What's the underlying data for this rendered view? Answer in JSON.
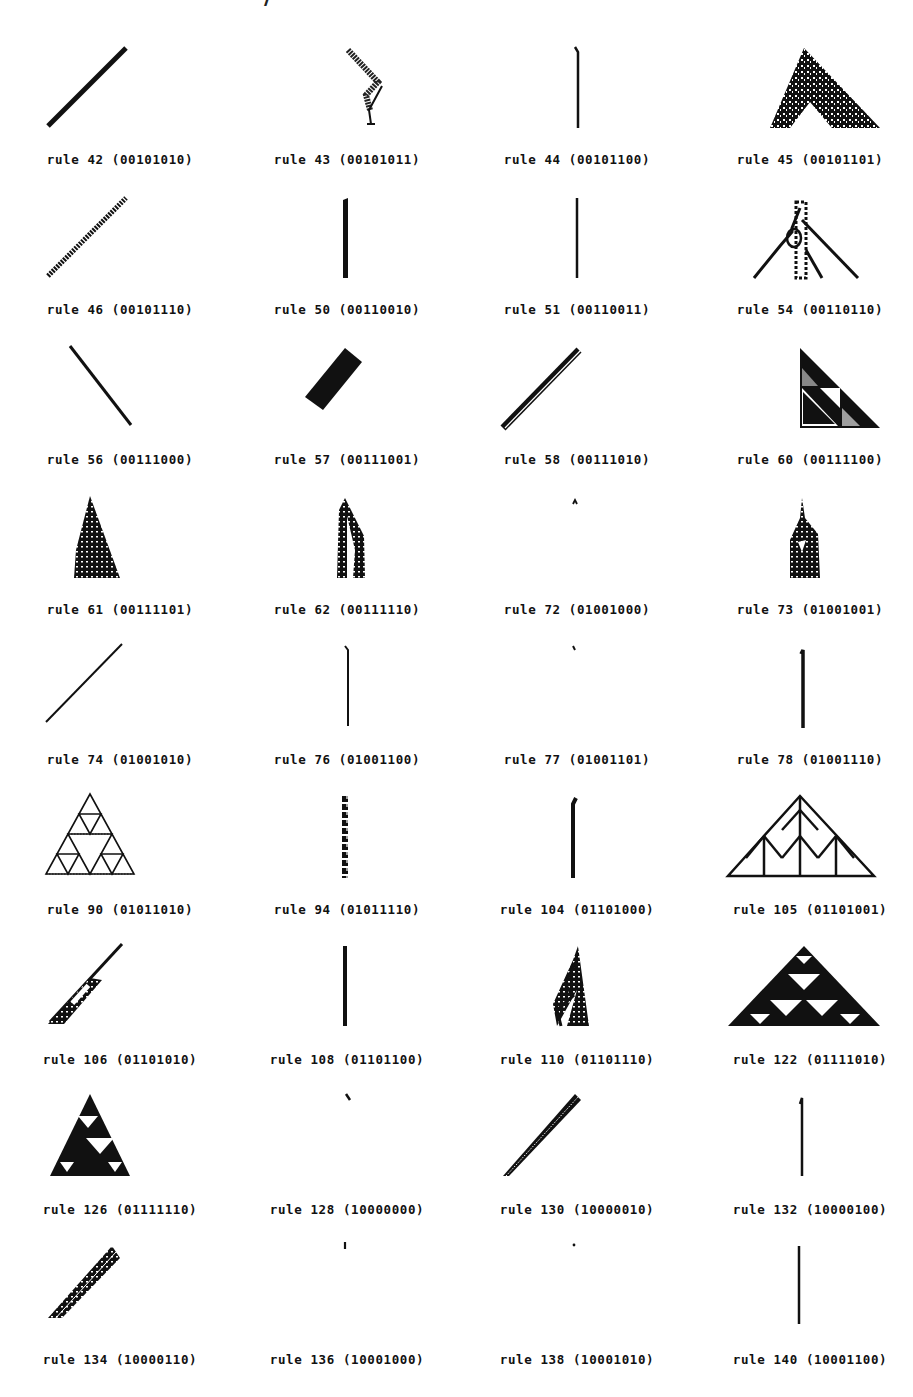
{
  "page": {
    "title_fragment": "…………  ……  ……, …/",
    "figure_type": "cellular automaton evolution patterns from single seed"
  },
  "patterns": [
    {
      "rule": 42,
      "label": "rule 42 (00101010)",
      "shape": "diag-right"
    },
    {
      "rule": 43,
      "label": "rule 43 (00101011)",
      "shape": "zigzag"
    },
    {
      "rule": 44,
      "label": "rule 44 (00101100)",
      "shape": "vertical-thin"
    },
    {
      "rule": 45,
      "label": "rule 45 (00101101)",
      "shape": "chaotic-triangle"
    },
    {
      "rule": 46,
      "label": "rule 46 (00101110)",
      "shape": "diag-right-dotted"
    },
    {
      "rule": 50,
      "label": "rule 50 (00110010)",
      "shape": "vertical-thick"
    },
    {
      "rule": 51,
      "label": "rule 51 (00110011)",
      "shape": "vertical-thin"
    },
    {
      "rule": 54,
      "label": "rule 54 (00110110)",
      "shape": "complex-triangle"
    },
    {
      "rule": 56,
      "label": "rule 56 (00111000)",
      "shape": "diag-left"
    },
    {
      "rule": 57,
      "label": "rule 57 (00111001)",
      "shape": "thick-band"
    },
    {
      "rule": 58,
      "label": "rule 58 (00111010)",
      "shape": "diag-right-double"
    },
    {
      "rule": 60,
      "label": "rule 60 (00111100)",
      "shape": "sierpinski-right"
    },
    {
      "rule": 61,
      "label": "rule 61 (00111101)",
      "shape": "chaotic-triangle-left"
    },
    {
      "rule": 62,
      "label": "rule 62 (00111110)",
      "shape": "patterned-spire"
    },
    {
      "rule": 72,
      "label": "rule 72 (01001000)",
      "shape": "tiny-caret"
    },
    {
      "rule": 73,
      "label": "rule 73 (01001001)",
      "shape": "chaotic-bell"
    },
    {
      "rule": 74,
      "label": "rule 74 (01001010)",
      "shape": "diag-right-thin"
    },
    {
      "rule": 76,
      "label": "rule 76 (01001100)",
      "shape": "vertical-thin"
    },
    {
      "rule": 77,
      "label": "rule 77 (01001101)",
      "shape": "tiny-tick"
    },
    {
      "rule": 78,
      "label": "rule 78 (01001110)",
      "shape": "vertical-medium"
    },
    {
      "rule": 90,
      "label": "rule 90 (01011010)",
      "shape": "sierpinski"
    },
    {
      "rule": 94,
      "label": "rule 94 (01011110)",
      "shape": "braided-column"
    },
    {
      "rule": 104,
      "label": "rule 104 (01101000)",
      "shape": "vertical-medium"
    },
    {
      "rule": 105,
      "label": "rule 105 (01101001)",
      "shape": "fractal-triangle"
    },
    {
      "rule": 106,
      "label": "rule 106 (01101010)",
      "shape": "diag-chaotic"
    },
    {
      "rule": 108,
      "label": "rule 108 (01101100)",
      "shape": "vertical-medium"
    },
    {
      "rule": 110,
      "label": "rule 110 (01101110)",
      "shape": "rule110-triangle"
    },
    {
      "rule": 122,
      "label": "rule 122 (01111010)",
      "shape": "sierpinski-filled"
    },
    {
      "rule": 126,
      "label": "rule 126 (01111110)",
      "shape": "sierpinski-filled"
    },
    {
      "rule": 128,
      "label": "rule 128 (10000000)",
      "shape": "tiny-tick"
    },
    {
      "rule": 130,
      "label": "rule 130 (10000010)",
      "shape": "diag-right-band"
    },
    {
      "rule": 132,
      "label": "rule 132 (10000100)",
      "shape": "vertical-thin"
    },
    {
      "rule": 134,
      "label": "rule 134 (10000110)",
      "shape": "diag-wide-band"
    },
    {
      "rule": 136,
      "label": "rule 136 (10001000)",
      "shape": "tiny-bar"
    },
    {
      "rule": 138,
      "label": "rule 138 (10001010)",
      "shape": "tiny-dot"
    },
    {
      "rule": 140,
      "label": "rule 140 (10001100)",
      "shape": "vertical-thin"
    }
  ]
}
